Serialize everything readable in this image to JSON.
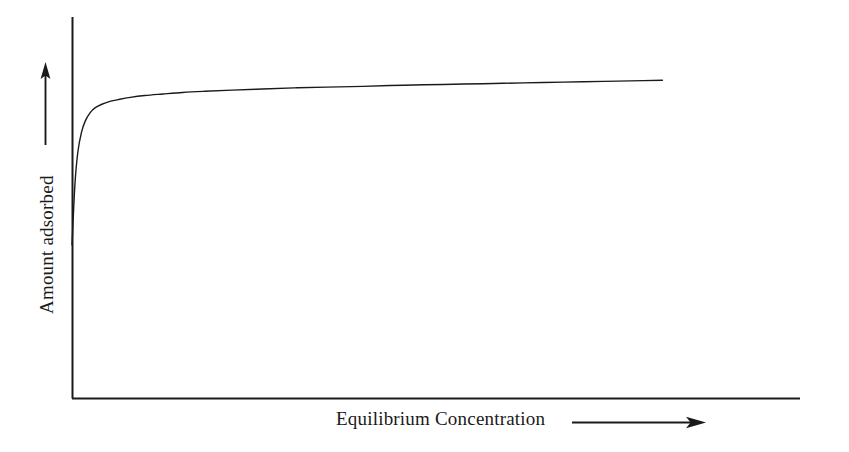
{
  "figure": {
    "background_color": "#ffffff",
    "ink_color": "#1a1a1a",
    "width": 849,
    "height": 452
  },
  "chart_data": {
    "type": "line",
    "title": "",
    "subtitle": "",
    "xlabel": "Equilibrium Concentration",
    "ylabel": "Amount adsorbed",
    "grid": false,
    "legend": null,
    "legend_position": "none",
    "axis_ticks": false,
    "tick_labels_x": [],
    "tick_labels_y": [],
    "xlim": [
      0,
      1
    ],
    "ylim": [
      0,
      1
    ],
    "series": [
      {
        "name": "Adsorption isotherm",
        "color": "#1a1a1a",
        "line_width": 1.4,
        "x": [
          0.0,
          0.004,
          0.008,
          0.013,
          0.018,
          0.025,
          0.032,
          0.041,
          0.051,
          0.063,
          0.08,
          0.1,
          0.125,
          0.152,
          0.182,
          0.22,
          0.262,
          0.305,
          0.35,
          0.4,
          0.455,
          0.51,
          0.565,
          0.62,
          0.675,
          0.73,
          0.785,
          0.811
        ],
        "y": [
          0.402,
          0.56,
          0.645,
          0.697,
          0.726,
          0.749,
          0.762,
          0.771,
          0.778,
          0.783,
          0.789,
          0.794,
          0.798,
          0.802,
          0.805,
          0.808,
          0.811,
          0.814,
          0.816,
          0.818,
          0.821,
          0.823,
          0.825,
          0.827,
          0.829,
          0.831,
          0.833,
          0.834
        ]
      }
    ],
    "curve_start_point": {
      "x": 0.0,
      "y": 0.402
    },
    "curve_end_point": {
      "x": 0.811,
      "y": 0.834
    },
    "plateau_level": 0.834
  },
  "axes": {
    "y_axis": {
      "name": "vertical-axis",
      "x": 72,
      "y_top": 17,
      "y_bottom": 398
    },
    "x_axis": {
      "name": "horizontal-axis",
      "y": 398,
      "x_left": 72,
      "x_right": 800
    }
  },
  "labels": {
    "y": {
      "text": "Amount adsorbed",
      "arrow_direction": "up",
      "orientation": "vertical"
    },
    "x": {
      "text": "Equilibrium Concentration",
      "arrow_direction": "right",
      "orientation": "horizontal"
    }
  }
}
